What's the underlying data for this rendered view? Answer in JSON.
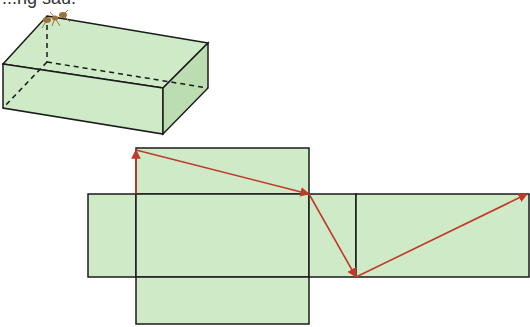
{
  "caption": "...ng sau.",
  "colors": {
    "face_fill": "#cfeac6",
    "face_side": "#bcdcb2",
    "edge": "#1b1b1b",
    "path": "#c0392b",
    "ant": "#a0703c"
  },
  "box": {
    "label": "cuboid-with-ant",
    "vertices": {
      "top_back_left": [
        47,
        16
      ],
      "top_back_right": [
        208,
        43
      ],
      "top_front_left": [
        3,
        64
      ],
      "top_front_right": [
        163,
        88
      ],
      "bottom_front_left": [
        3,
        108
      ],
      "bottom_front_right": [
        163,
        134
      ],
      "bottom_back_right": [
        208,
        88
      ],
      "bottom_back_left_hidden": [
        47,
        62
      ]
    }
  },
  "net": {
    "faces": [
      {
        "name": "top-flap",
        "x": 136,
        "y": 148,
        "w": 173,
        "h": 46
      },
      {
        "name": "left-flap",
        "x": 88,
        "y": 194,
        "w": 48,
        "h": 83
      },
      {
        "name": "center-face",
        "x": 136,
        "y": 194,
        "w": 173,
        "h": 83
      },
      {
        "name": "right-side-face",
        "x": 309,
        "y": 194,
        "w": 47,
        "h": 83
      },
      {
        "name": "back-face",
        "x": 356,
        "y": 194,
        "w": 173,
        "h": 83
      },
      {
        "name": "bottom-flap",
        "x": 136,
        "y": 277,
        "w": 173,
        "h": 47
      }
    ],
    "path_segments": [
      {
        "from": [
          136,
          194
        ],
        "to": [
          136,
          150
        ]
      },
      {
        "from": [
          136,
          150
        ],
        "to": [
          309,
          194
        ]
      },
      {
        "from": [
          309,
          194
        ],
        "to": [
          356,
          277
        ]
      },
      {
        "from": [
          356,
          277
        ],
        "to": [
          527,
          194
        ]
      }
    ]
  }
}
